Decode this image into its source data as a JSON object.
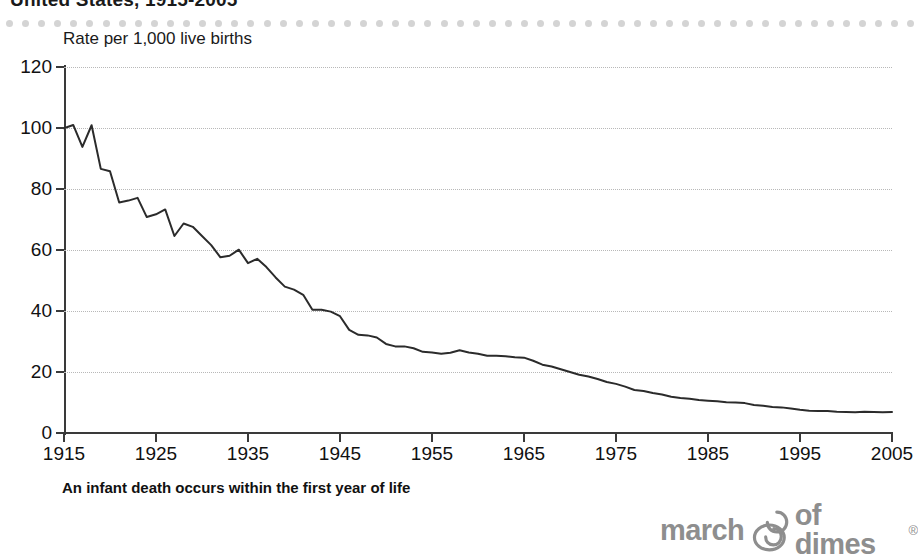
{
  "title": "United States, 1915-2005",
  "axis_caption": "Rate per 1,000 live births",
  "footnote": "An infant death occurs within the first year of life",
  "logo": {
    "word_left": "march",
    "word_right": "of dimes",
    "trademark": "®",
    "mark_icon": "mother-and-baby-icon",
    "color": "#8e8e8e"
  },
  "decoration": {
    "dot_color": "#d4d4d4",
    "dot_count": 57
  },
  "chart_data": {
    "type": "line",
    "title": "United States, 1915-2005",
    "subtitle": "",
    "xlabel": "",
    "ylabel": "Rate per 1,000 live births",
    "xlim": [
      1915,
      2005
    ],
    "ylim": [
      0,
      120
    ],
    "yticks": [
      0,
      20,
      40,
      60,
      80,
      100,
      120
    ],
    "xticks": [
      1915,
      1925,
      1935,
      1945,
      1955,
      1965,
      1975,
      1985,
      1995,
      2005
    ],
    "grid": true,
    "grid_axis": "y",
    "grid_style": "dotted",
    "legend": false,
    "line_color": "#2b2b2b",
    "line_width": 2,
    "annotations": [
      "An infant death occurs within the first year of life"
    ],
    "series": [
      {
        "name": "Infant mortality rate",
        "x": [
          1915,
          1916,
          1917,
          1918,
          1919,
          1920,
          1921,
          1922,
          1923,
          1924,
          1925,
          1926,
          1927,
          1928,
          1929,
          1930,
          1931,
          1932,
          1933,
          1934,
          1935,
          1936,
          1937,
          1938,
          1939,
          1940,
          1941,
          1942,
          1943,
          1944,
          1945,
          1946,
          1947,
          1948,
          1949,
          1950,
          1951,
          1952,
          1953,
          1954,
          1955,
          1956,
          1957,
          1958,
          1959,
          1960,
          1961,
          1962,
          1963,
          1964,
          1965,
          1966,
          1967,
          1968,
          1969,
          1970,
          1971,
          1972,
          1973,
          1974,
          1975,
          1976,
          1977,
          1978,
          1979,
          1980,
          1981,
          1982,
          1983,
          1984,
          1985,
          1986,
          1987,
          1988,
          1989,
          1990,
          1991,
          1992,
          1993,
          1994,
          1995,
          1996,
          1997,
          1998,
          1999,
          2000,
          2001,
          2002,
          2003,
          2004,
          2005
        ],
        "values": [
          99.9,
          101.0,
          93.8,
          100.9,
          86.6,
          85.8,
          75.6,
          76.2,
          77.1,
          70.8,
          71.7,
          73.3,
          64.6,
          68.7,
          67.6,
          64.6,
          61.6,
          57.6,
          58.1,
          60.1,
          55.7,
          57.1,
          54.4,
          51.0,
          48.0,
          47.0,
          45.3,
          40.4,
          40.4,
          39.8,
          38.3,
          33.8,
          32.2,
          32.0,
          31.3,
          29.2,
          28.4,
          28.4,
          27.8,
          26.6,
          26.4,
          26.0,
          26.3,
          27.1,
          26.4,
          26.0,
          25.3,
          25.3,
          25.2,
          24.8,
          24.7,
          23.7,
          22.4,
          21.8,
          20.9,
          20.0,
          19.1,
          18.5,
          17.7,
          16.7,
          16.1,
          15.2,
          14.1,
          13.8,
          13.1,
          12.6,
          11.9,
          11.5,
          11.2,
          10.8,
          10.6,
          10.4,
          10.1,
          10.0,
          9.8,
          9.2,
          8.9,
          8.5,
          8.4,
          8.0,
          7.6,
          7.3,
          7.2,
          7.2,
          7.0,
          6.9,
          6.8,
          7.0,
          6.9,
          6.8,
          6.9
        ]
      }
    ]
  }
}
